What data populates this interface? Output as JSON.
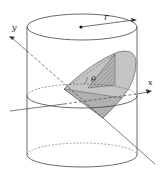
{
  "figure": {
    "labels": {
      "radius": "r",
      "angle": "θ",
      "x_axis": "x",
      "y_axis": "y"
    },
    "colors": {
      "stroke": "#333333",
      "wedge_fill": "#bdbdbd",
      "wedge_light": "#d6d6d6",
      "hatch": "#8a8a8a",
      "background": "#ffffff"
    }
  }
}
